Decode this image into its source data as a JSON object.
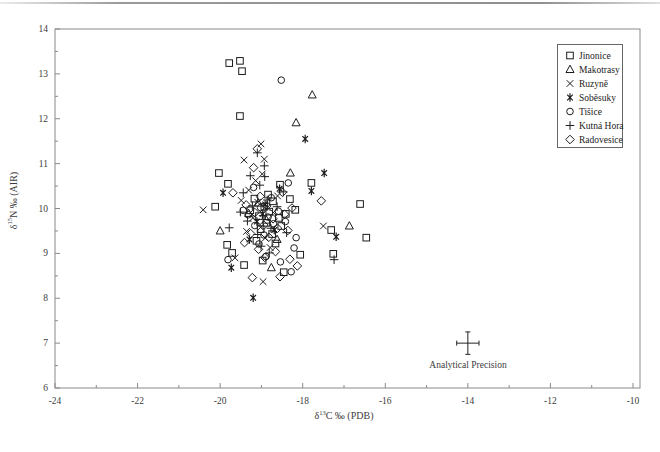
{
  "chart_data": {
    "type": "scatter",
    "title": "",
    "xlabel": {
      "delta": "δ",
      "sup": "13",
      "rest": "C ‰ (PDB)"
    },
    "ylabel": {
      "delta": "δ",
      "sup": "15",
      "rest": "N ‰ (AIR)"
    },
    "xlim": [
      -24,
      -10
    ],
    "ylim": [
      6,
      14
    ],
    "x_ticks": [
      -24,
      -22,
      -20,
      -18,
      -16,
      -14,
      -12,
      -10
    ],
    "y_ticks": [
      6,
      7,
      8,
      9,
      10,
      11,
      12,
      13,
      14
    ],
    "x_minor_step": 1,
    "y_minor_step": 0.5,
    "grid": false,
    "legend_position": "top-right",
    "series": [
      {
        "name": "Jinonice",
        "marker": "square",
        "points": [
          [
            -19.78,
            13.24
          ],
          [
            -19.52,
            13.29
          ],
          [
            -19.47,
            13.06
          ],
          [
            -19.52,
            12.06
          ],
          [
            -20.03,
            10.79
          ],
          [
            -19.81,
            10.55
          ],
          [
            -20.12,
            10.04
          ],
          [
            -18.55,
            10.53
          ],
          [
            -18.18,
            9.97
          ],
          [
            -17.79,
            10.57
          ],
          [
            -16.61,
            10.1
          ],
          [
            -16.46,
            9.35
          ],
          [
            -17.31,
            9.52
          ],
          [
            -17.26,
            8.99
          ],
          [
            -19.83,
            9.19
          ],
          [
            -19.71,
            9.01
          ],
          [
            -19.42,
            8.74
          ],
          [
            -18.06,
            8.97
          ],
          [
            -19.17,
            10.22
          ],
          [
            -18.93,
            10.04
          ],
          [
            -18.81,
            9.93
          ],
          [
            -19.06,
            9.83
          ],
          [
            -18.72,
            10.16
          ],
          [
            -18.88,
            9.68
          ],
          [
            -19.27,
            9.96
          ],
          [
            -18.58,
            9.79
          ],
          [
            -18.84,
            10.31
          ],
          [
            -19.02,
            9.54
          ],
          [
            -18.74,
            9.43
          ],
          [
            -19.12,
            9.28
          ],
          [
            -18.52,
            9.61
          ],
          [
            -18.66,
            9.22
          ],
          [
            -18.41,
            9.88
          ],
          [
            -18.31,
            10.21
          ],
          [
            -18.97,
            8.84
          ],
          [
            -18.46,
            8.58
          ]
        ]
      },
      {
        "name": "Makotrasy",
        "marker": "triangle",
        "points": [
          [
            -17.77,
            12.53
          ],
          [
            -18.16,
            11.91
          ],
          [
            -18.3,
            10.79
          ],
          [
            -18.76,
            8.68
          ],
          [
            -16.87,
            9.61
          ],
          [
            -20.0,
            9.5
          ],
          [
            -19.08,
            10.12
          ],
          [
            -18.88,
            9.74
          ],
          [
            -18.62,
            9.31
          ],
          [
            -19.31,
            9.89
          ]
        ]
      },
      {
        "name": "Ruzyně",
        "marker": "x",
        "points": [
          [
            -19.01,
            11.44
          ],
          [
            -19.42,
            11.08
          ],
          [
            -18.93,
            11.1
          ],
          [
            -18.98,
            10.77
          ],
          [
            -20.41,
            9.97
          ],
          [
            -19.64,
            8.9
          ],
          [
            -18.96,
            8.37
          ],
          [
            -17.5,
            9.61
          ],
          [
            -19.31,
            10.41
          ],
          [
            -19.09,
            10.14
          ],
          [
            -18.86,
            10.02
          ],
          [
            -19.21,
            9.79
          ],
          [
            -18.71,
            9.91
          ],
          [
            -19.02,
            9.58
          ],
          [
            -18.91,
            9.34
          ],
          [
            -19.36,
            9.49
          ],
          [
            -18.61,
            10.28
          ],
          [
            -19.14,
            10.62
          ],
          [
            -18.79,
            9.13
          ],
          [
            -19.49,
            10.18
          ]
        ]
      },
      {
        "name": "Soběsuky",
        "marker": "star",
        "points": [
          [
            -17.94,
            11.55
          ],
          [
            -17.48,
            10.79
          ],
          [
            -17.79,
            10.39
          ],
          [
            -19.93,
            10.35
          ],
          [
            -19.73,
            8.68
          ],
          [
            -19.2,
            8.01
          ],
          [
            -17.19,
            9.37
          ],
          [
            -18.91,
            10.09
          ],
          [
            -19.11,
            9.71
          ],
          [
            -18.69,
            9.52
          ],
          [
            -18.97,
            9.88
          ],
          [
            -19.29,
            9.31
          ],
          [
            -18.56,
            10.44
          ]
        ]
      },
      {
        "name": "Tišice",
        "marker": "circle",
        "points": [
          [
            -18.52,
            12.86
          ],
          [
            -18.35,
            10.57
          ],
          [
            -18.16,
            9.35
          ],
          [
            -18.21,
            9.12
          ],
          [
            -18.28,
            8.59
          ],
          [
            -19.81,
            8.86
          ],
          [
            -19.02,
            10.02
          ],
          [
            -18.84,
            9.81
          ],
          [
            -19.16,
            9.62
          ],
          [
            -18.94,
            9.41
          ],
          [
            -19.32,
            9.86
          ],
          [
            -18.71,
            9.66
          ],
          [
            -18.59,
            9.94
          ],
          [
            -19.06,
            9.21
          ],
          [
            -18.89,
            8.93
          ],
          [
            -18.42,
            9.71
          ],
          [
            -19.44,
            9.96
          ],
          [
            -18.76,
            10.24
          ],
          [
            -18.54,
            8.81
          ],
          [
            -19.19,
            10.47
          ]
        ]
      },
      {
        "name": "Kutná Hora",
        "marker": "plus",
        "points": [
          [
            -19.1,
            11.24
          ],
          [
            -18.93,
            10.95
          ],
          [
            -19.27,
            10.73
          ],
          [
            -19.44,
            10.35
          ],
          [
            -18.47,
            10.37
          ],
          [
            -17.24,
            8.86
          ],
          [
            -19.78,
            9.57
          ],
          [
            -19.04,
            10.52
          ],
          [
            -18.86,
            10.19
          ],
          [
            -19.22,
            10.06
          ],
          [
            -18.96,
            9.84
          ],
          [
            -19.34,
            9.72
          ],
          [
            -18.77,
            9.56
          ],
          [
            -19.09,
            9.42
          ],
          [
            -18.62,
            10.04
          ],
          [
            -18.92,
            10.71
          ],
          [
            -19.51,
            9.92
          ],
          [
            -18.81,
            9.01
          ],
          [
            -19.01,
            9.16
          ],
          [
            -18.39,
            9.46
          ]
        ]
      },
      {
        "name": "Radovesice",
        "marker": "diamond",
        "points": [
          [
            -19.1,
            11.33
          ],
          [
            -19.19,
            10.91
          ],
          [
            -19.69,
            10.35
          ],
          [
            -17.55,
            10.17
          ],
          [
            -18.13,
            8.72
          ],
          [
            -18.55,
            8.48
          ],
          [
            -19.22,
            8.46
          ],
          [
            -19.03,
            10.27
          ],
          [
            -18.87,
            10.06
          ],
          [
            -19.16,
            9.91
          ],
          [
            -18.94,
            9.63
          ],
          [
            -19.26,
            9.44
          ],
          [
            -18.72,
            9.77
          ],
          [
            -18.82,
            9.36
          ],
          [
            -19.07,
            9.09
          ],
          [
            -18.61,
            9.56
          ],
          [
            -18.44,
            9.87
          ],
          [
            -19.37,
            10.08
          ],
          [
            -18.92,
            8.91
          ],
          [
            -18.66,
            9.04
          ],
          [
            -18.36,
            9.51
          ],
          [
            -19.41,
            9.24
          ],
          [
            -18.26,
            10.01
          ],
          [
            -18.49,
            10.36
          ],
          [
            -18.31,
            8.87
          ]
        ]
      }
    ],
    "annotation": {
      "label": "Analytical Precision",
      "x": -14,
      "y": 7,
      "xerr": 0.27,
      "yerr": 0.25
    }
  },
  "colors": {
    "marker": "#1c1c1c",
    "frame": "#8a8a8a",
    "tick": "#8a8a8a",
    "text": "#3c3c3c"
  }
}
